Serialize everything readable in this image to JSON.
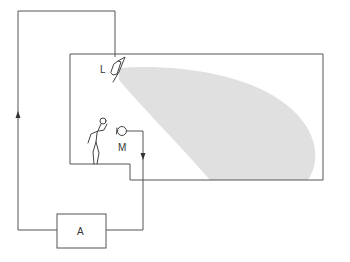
{
  "diagram": {
    "labels": {
      "loudspeaker": "L",
      "microphone": "M",
      "amplifier": "A"
    },
    "colors": {
      "line": "#555555",
      "beam": "#e0e0e0",
      "background": "#ffffff"
    },
    "components": [
      {
        "id": "loudspeaker",
        "label": "L",
        "description": "Loudspeaker mounted on room ceiling, radiating sound beam"
      },
      {
        "id": "microphone",
        "label": "M",
        "description": "Microphone near speaking person"
      },
      {
        "id": "amplifier",
        "label": "A",
        "description": "Amplifier box outside the room"
      },
      {
        "id": "person",
        "label": "",
        "description": "Stick figure speaker standing on stage"
      },
      {
        "id": "room",
        "label": "",
        "description": "Room outline with raised stage step"
      }
    ],
    "signal_flow": [
      "M",
      "A",
      "L"
    ]
  }
}
